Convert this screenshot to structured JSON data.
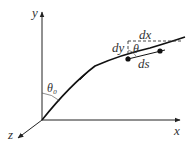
{
  "diagram": {
    "axes": {
      "x_label": "x",
      "y_label": "y",
      "z_label": "z"
    },
    "angles": {
      "theta0_label": "θ₀",
      "theta_label": "θ"
    },
    "differentials": {
      "dx_label": "dx",
      "dy_label": "dy",
      "ds_label": "ds"
    },
    "colors": {
      "stroke": "#222222",
      "background": "#ffffff"
    }
  }
}
